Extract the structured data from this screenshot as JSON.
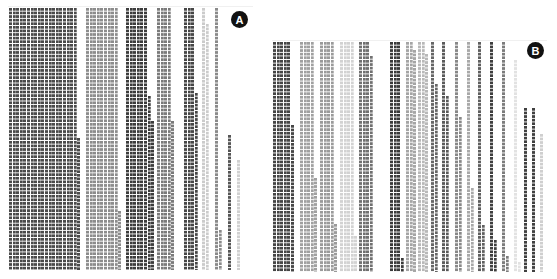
{
  "chart_data": [
    {
      "type": "waffle",
      "title": "",
      "label": "A",
      "panel": {
        "x": 8,
        "y": 8,
        "width": 245,
        "bottom": 270
      },
      "cell_pitch": 3.6,
      "groups": [
        {
          "color": "#4a4a4a",
          "subcols": [
            [
              9,
              8
            ],
            [
              12.6,
              8
            ],
            [
              16.2,
              8
            ],
            [
              19.8,
              8
            ],
            [
              23.4,
              8
            ],
            [
              27,
              8
            ],
            [
              30.6,
              8
            ],
            [
              34.2,
              8
            ],
            [
              37.8,
              8
            ],
            [
              41.4,
              8
            ],
            [
              45,
              8
            ],
            [
              48.6,
              8
            ],
            [
              52.2,
              8
            ],
            [
              55.8,
              8
            ],
            [
              59.4,
              8
            ],
            [
              63,
              8
            ],
            [
              66.6,
              8
            ],
            [
              70.2,
              8
            ],
            [
              73.8,
              8
            ],
            [
              77.4,
              138
            ]
          ]
        },
        {
          "color": "#8c8c8c",
          "subcols": [
            [
              86,
              8
            ],
            [
              89.6,
              8
            ],
            [
              93.2,
              8
            ],
            [
              96.8,
              8
            ],
            [
              100.4,
              8
            ],
            [
              104,
              8
            ],
            [
              107.6,
              8
            ],
            [
              111.2,
              8
            ],
            [
              114.8,
              8
            ],
            [
              118.4,
              211
            ]
          ]
        },
        {
          "color": "#3c3c3c",
          "subcols": [
            [
              126,
              8
            ],
            [
              129.6,
              8
            ],
            [
              133.2,
              8
            ],
            [
              136.8,
              8
            ],
            [
              140.4,
              8
            ],
            [
              144,
              8
            ],
            [
              147.6,
              96
            ],
            [
              151.2,
              121
            ]
          ]
        },
        {
          "color": "#7a7a7a",
          "subcols": [
            [
              157,
              8
            ],
            [
              160.6,
              8
            ],
            [
              164.2,
              8
            ],
            [
              167.8,
              8
            ],
            [
              171.4,
              121
            ]
          ]
        },
        {
          "color": "#464646",
          "subcols": [
            [
              184,
              8
            ],
            [
              187.6,
              8
            ],
            [
              191.2,
              8
            ],
            [
              194.8,
              93
            ]
          ]
        },
        {
          "color": "#cbcbcb",
          "subcols": [
            [
              202,
              8
            ],
            [
              205.6,
              24
            ]
          ]
        },
        {
          "color": "#8a8a8a",
          "subcols": [
            [
              215,
              8
            ],
            [
              218.6,
              230
            ]
          ]
        },
        {
          "color": "#555555",
          "subcols": [
            [
              228,
              135
            ]
          ]
        },
        {
          "color": "#d0d0d0",
          "subcols": [
            [
              237,
              160
            ]
          ]
        }
      ]
    },
    {
      "type": "waffle",
      "title": "",
      "label": "B",
      "panel": {
        "x": 272,
        "y": 42,
        "width": 275,
        "bottom": 272
      },
      "cell_pitch": 3.6,
      "groups": [
        {
          "color": "#454545",
          "subcols": [
            [
              273,
              42
            ],
            [
              276.6,
              42
            ],
            [
              280.2,
              42
            ],
            [
              283.8,
              42
            ],
            [
              287.4,
              42
            ],
            [
              291,
              125
            ]
          ]
        },
        {
          "color": "#a0a0a0",
          "subcols": [
            [
              300,
              42
            ],
            [
              303.6,
              42
            ],
            [
              307.2,
              42
            ],
            [
              310.8,
              42
            ],
            [
              314.4,
              178
            ]
          ]
        },
        {
          "color": "#9a9a9a",
          "subcols": [
            [
              320,
              42
            ],
            [
              323.6,
              42
            ],
            [
              327.2,
              42
            ],
            [
              330.8,
              42
            ],
            [
              334.4,
              224
            ]
          ]
        },
        {
          "color": "#d2d2d2",
          "subcols": [
            [
              340,
              42
            ],
            [
              343.6,
              42
            ],
            [
              347.2,
              42
            ],
            [
              350.8,
              42
            ],
            [
              354.4,
              236
            ]
          ]
        },
        {
          "color": "#707070",
          "subcols": [
            [
              359,
              42
            ],
            [
              362.6,
              42
            ],
            [
              366.2,
              42
            ],
            [
              369.8,
              56
            ]
          ]
        },
        {
          "color": "#3a3a3a",
          "subcols": [
            [
              390,
              42
            ],
            [
              393.6,
              42
            ],
            [
              397.2,
              42
            ],
            [
              400.8,
              258
            ]
          ]
        },
        {
          "color": "#a5a5a5",
          "subcols": [
            [
              406,
              42
            ],
            [
              409.6,
              42
            ],
            [
              413.2,
              50
            ]
          ]
        },
        {
          "color": "#b8b8b8",
          "subcols": [
            [
              418,
              42
            ],
            [
              421.6,
              42
            ],
            [
              425.2,
              54
            ]
          ]
        },
        {
          "color": "#666666",
          "subcols": [
            [
              431,
              42
            ],
            [
              434.6,
              84
            ]
          ]
        },
        {
          "color": "#5a5a5a",
          "subcols": [
            [
              442,
              42
            ],
            [
              445.6,
              96
            ]
          ]
        },
        {
          "color": "#888888",
          "subcols": [
            [
              455,
              42
            ],
            [
              458.6,
              117
            ]
          ]
        },
        {
          "color": "#a8a8a8",
          "subcols": [
            [
              467,
              42
            ],
            [
              470.6,
              188
            ]
          ]
        },
        {
          "color": "#5f5f5f",
          "subcols": [
            [
              478,
              42
            ],
            [
              481.6,
              225
            ]
          ]
        },
        {
          "color": "#3e3e3e",
          "subcols": [
            [
              490,
              42
            ],
            [
              493.6,
              240
            ]
          ]
        },
        {
          "color": "#7c7c7c",
          "subcols": [
            [
              502,
              42
            ],
            [
              505.6,
              256
            ]
          ]
        },
        {
          "color": "#e2e2e2",
          "subcols": [
            [
              514,
              60
            ],
            [
              517.6,
              262
            ]
          ]
        },
        {
          "color": "#404040",
          "subcols": [
            [
              524,
              108
            ]
          ]
        },
        {
          "color": "#404040",
          "subcols": [
            [
              532,
              108
            ]
          ]
        },
        {
          "color": "#cfcfcf",
          "subcols": [
            [
              540,
              134
            ]
          ]
        }
      ]
    }
  ],
  "panels": {
    "a": {
      "label": "A",
      "badge_x": 231,
      "badge_y": 11
    },
    "b": {
      "label": "B",
      "badge_x": 527,
      "badge_y": 42
    }
  }
}
